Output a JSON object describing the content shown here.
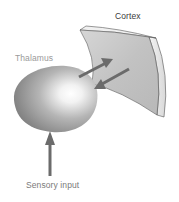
{
  "diagram": {
    "labels": {
      "cortex": "Cortex",
      "thalamus": "Thalamus",
      "sensory_input": "Sensory input"
    },
    "nodes": [
      {
        "id": "cortex",
        "shape": "curved-slab"
      },
      {
        "id": "thalamus",
        "shape": "ovoid-sphere"
      }
    ],
    "edges": [
      {
        "from": "sensory_input",
        "to": "thalamus",
        "direction": "up"
      },
      {
        "from": "thalamus",
        "to": "cortex",
        "direction": "feedforward"
      },
      {
        "from": "cortex",
        "to": "thalamus",
        "direction": "feedback"
      }
    ],
    "colors": {
      "arrow": "#6b6b6b",
      "cortex_face": "#c4c4c4",
      "cortex_edge": "#eeeeee",
      "thalamus_dark": "#7a7a7a",
      "thalamus_light": "#ffffff"
    }
  }
}
